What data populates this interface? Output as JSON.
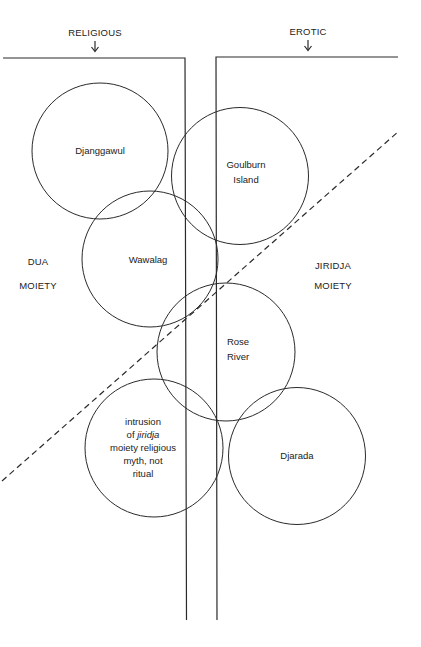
{
  "diagram": {
    "headers": {
      "left": "RELIGIOUS",
      "right": "EROTIC"
    },
    "side_labels": {
      "left": {
        "line1": "DUA",
        "line2": "MOIETY"
      },
      "right": {
        "line1": "JIRIDJA",
        "line2": "MOIETY"
      }
    },
    "circles": [
      {
        "id": "djanggawul",
        "lines": [
          "Djanggawul"
        ]
      },
      {
        "id": "goulburn-island",
        "lines": [
          "Goulburn",
          "Island"
        ]
      },
      {
        "id": "wawalag",
        "lines": [
          "Wawalag"
        ]
      },
      {
        "id": "rose-river",
        "lines": [
          "Rose",
          "River"
        ]
      },
      {
        "id": "intrusion",
        "lines": [
          "intrusion",
          "of",
          "jiridja",
          "moiety religious",
          "myth, not",
          "ritual"
        ]
      },
      {
        "id": "djarada",
        "lines": [
          "Djarada"
        ]
      }
    ],
    "divider": "dashed diagonal line separating dua and jiridja moieties"
  }
}
